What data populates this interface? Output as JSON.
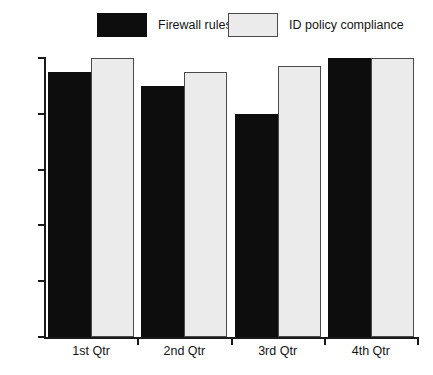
{
  "chart_data": {
    "type": "bar",
    "title": "",
    "subtitle": "",
    "xlabel": "",
    "ylabel": "",
    "categories": [
      "1st Qtr",
      "2nd Qtr",
      "3rd Qtr",
      "4th Qtr"
    ],
    "series": [
      {
        "name": "Firewall rules",
        "color": "#0d0d0d",
        "border_color": "#0d0d0d",
        "values": [
          95,
          90,
          80,
          100
        ]
      },
      {
        "name": "ID policy compliance",
        "color": "#ebebeb",
        "border_color": "#4a4a4a",
        "values": [
          100,
          95,
          97,
          100
        ]
      }
    ],
    "ylim": [
      0,
      100
    ],
    "yticks": [
      0,
      20,
      40,
      60,
      80,
      100
    ],
    "ytick_labels": [
      "0",
      "20",
      "40",
      "60",
      "80",
      "100"
    ],
    "grid": false,
    "legend_position": "top",
    "axis_color": "#1a1a1a",
    "background": "#ffffff"
  },
  "legend": {
    "entries": [
      {
        "label": "Firewall rules"
      },
      {
        "label": "ID policy compliance"
      }
    ]
  }
}
